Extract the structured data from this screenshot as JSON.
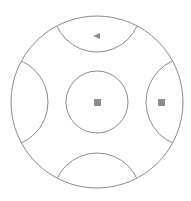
{
  "board": {
    "shape": "circle",
    "outer": {
      "cx": 97,
      "cy": 102,
      "r": 86
    },
    "center_circle": {
      "cx": 97,
      "cy": 102,
      "r": 31
    },
    "regions": [
      {
        "name": "top",
        "cx": 97,
        "cy": 8,
        "r": 44
      },
      {
        "name": "bottom",
        "cx": 97,
        "cy": 196,
        "r": 44
      },
      {
        "name": "left",
        "cx": 3,
        "cy": 102,
        "r": 45
      },
      {
        "name": "right",
        "cx": 191,
        "cy": 102,
        "r": 45
      }
    ],
    "markers": [
      {
        "region": "top",
        "icon": "triangle-left-icon"
      },
      {
        "region": "center",
        "icon": "square-icon"
      },
      {
        "region": "right",
        "icon": "square-icon"
      }
    ]
  },
  "colors": {
    "stroke": "#8a8a8a",
    "marker": "#8c8c8c",
    "background": "#ffffff"
  }
}
